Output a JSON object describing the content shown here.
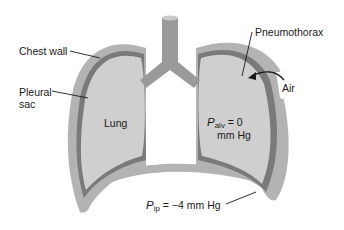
{
  "diagram": {
    "labels": {
      "chest_wall": "Chest wall",
      "pleural_sac_line1": "Pleural",
      "pleural_sac_line2": "sac",
      "lung": "Lung",
      "pneumothorax": "Pneumothorax",
      "air": "Air",
      "p_alv_symbol": "P",
      "p_alv_sub": "alv",
      "p_alv_value": " = 0",
      "p_alv_unit": "mm Hg",
      "p_ip_symbol": "P",
      "p_ip_sub": "ip",
      "p_ip_value": " = −4 mm Hg"
    },
    "colors": {
      "chest_wall": "#b3b3b3",
      "pleural_membrane": "#7a7a7a",
      "lung_tissue": "#cfcfcf",
      "trachea": "#9a9a9a",
      "leader_line": "#1a1a1a",
      "background": "#ffffff"
    }
  }
}
